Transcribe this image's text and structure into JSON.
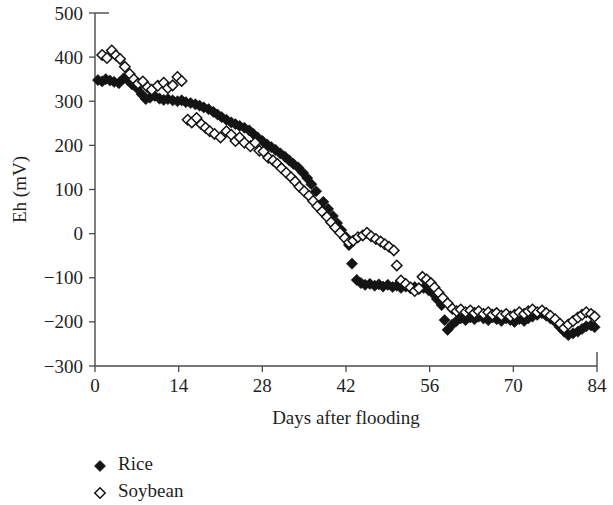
{
  "chart_data": {
    "type": "scatter",
    "title": "",
    "xlabel": "Days after flooding",
    "ylabel": "Eh (mV)",
    "xlim": [
      0,
      84
    ],
    "ylim": [
      -300,
      500
    ],
    "xticks": [
      0,
      14,
      28,
      42,
      56,
      70,
      84
    ],
    "yticks": [
      -300,
      -200,
      -100,
      0,
      100,
      200,
      300,
      400,
      500
    ],
    "xtick_labels": [
      "0",
      "14",
      "28",
      "42",
      "56",
      "70",
      "84"
    ],
    "ytick_labels": [
      "−300",
      "−200",
      "−100",
      "0",
      "100",
      "200",
      "300",
      "400",
      "500"
    ],
    "grid": false,
    "legend_position": "below-left",
    "series": [
      {
        "name": "Rice",
        "marker": "filled-diamond",
        "color": "#141414",
        "points": [
          [
            0.5,
            348
          ],
          [
            1.2,
            345
          ],
          [
            1.8,
            350
          ],
          [
            2.5,
            347
          ],
          [
            3.2,
            344
          ],
          [
            4.0,
            341
          ],
          [
            4.8,
            352
          ],
          [
            5.5,
            348
          ],
          [
            6.2,
            338
          ],
          [
            7.0,
            330
          ],
          [
            7.8,
            316
          ],
          [
            8.5,
            305
          ],
          [
            9.2,
            308
          ],
          [
            10.0,
            312
          ],
          [
            10.8,
            306
          ],
          [
            11.5,
            303
          ],
          [
            12.2,
            305
          ],
          [
            13.0,
            302
          ],
          [
            13.8,
            300
          ],
          [
            14.5,
            302
          ],
          [
            15.2,
            298
          ],
          [
            16.0,
            296
          ],
          [
            16.8,
            293
          ],
          [
            17.5,
            290
          ],
          [
            18.2,
            286
          ],
          [
            19.0,
            282
          ],
          [
            19.8,
            276
          ],
          [
            20.5,
            270
          ],
          [
            21.2,
            264
          ],
          [
            22.0,
            258
          ],
          [
            22.8,
            252
          ],
          [
            23.5,
            248
          ],
          [
            24.2,
            244
          ],
          [
            25.0,
            240
          ],
          [
            25.8,
            234
          ],
          [
            26.5,
            226
          ],
          [
            27.2,
            218
          ],
          [
            28.0,
            210
          ],
          [
            28.8,
            202
          ],
          [
            29.5,
            196
          ],
          [
            30.2,
            190
          ],
          [
            31.0,
            182
          ],
          [
            31.8,
            174
          ],
          [
            32.5,
            166
          ],
          [
            33.2,
            158
          ],
          [
            34.0,
            150
          ],
          [
            34.8,
            138
          ],
          [
            35.5,
            126
          ],
          [
            36.2,
            112
          ],
          [
            37.0,
            96
          ],
          [
            37.5,
            62
          ],
          [
            38.2,
            72
          ],
          [
            39.0,
            56
          ],
          [
            39.8,
            40
          ],
          [
            40.5,
            24
          ],
          [
            41.2,
            8
          ],
          [
            42.0,
            -8
          ],
          [
            42.5,
            -26
          ],
          [
            43.0,
            -68
          ],
          [
            43.8,
            -105
          ],
          [
            44.5,
            -112
          ],
          [
            45.2,
            -116
          ],
          [
            46.0,
            -114
          ],
          [
            46.8,
            -118
          ],
          [
            47.5,
            -115
          ],
          [
            48.2,
            -120
          ],
          [
            49.0,
            -116
          ],
          [
            49.8,
            -121
          ],
          [
            50.5,
            -118
          ],
          [
            51.2,
            -123
          ],
          [
            52.0,
            -120
          ],
          [
            52.8,
            -124
          ],
          [
            53.5,
            -121
          ],
          [
            54.2,
            -126
          ],
          [
            55.0,
            -123
          ],
          [
            55.8,
            -128
          ],
          [
            56.5,
            -135
          ],
          [
            57.2,
            -148
          ],
          [
            58.0,
            -162
          ],
          [
            58.5,
            -196
          ],
          [
            59.0,
            -218
          ],
          [
            59.8,
            -206
          ],
          [
            60.5,
            -198
          ],
          [
            61.2,
            -192
          ],
          [
            62.0,
            -196
          ],
          [
            62.8,
            -190
          ],
          [
            63.5,
            -194
          ],
          [
            64.2,
            -188
          ],
          [
            65.0,
            -192
          ],
          [
            65.8,
            -196
          ],
          [
            66.5,
            -190
          ],
          [
            67.2,
            -194
          ],
          [
            68.0,
            -198
          ],
          [
            68.8,
            -192
          ],
          [
            69.5,
            -196
          ],
          [
            70.2,
            -200
          ],
          [
            71.0,
            -194
          ],
          [
            71.8,
            -198
          ],
          [
            72.5,
            -192
          ],
          [
            73.2,
            -188
          ],
          [
            74.0,
            -184
          ],
          [
            74.8,
            -180
          ],
          [
            75.5,
            -186
          ],
          [
            76.2,
            -192
          ],
          [
            77.0,
            -200
          ],
          [
            77.8,
            -212
          ],
          [
            78.5,
            -222
          ],
          [
            79.2,
            -230
          ],
          [
            80.0,
            -226
          ],
          [
            80.8,
            -222
          ],
          [
            81.5,
            -216
          ],
          [
            82.2,
            -210
          ],
          [
            83.0,
            -208
          ],
          [
            83.6,
            -212
          ]
        ]
      },
      {
        "name": "Soybean",
        "marker": "open-diamond",
        "color": "#ffffff",
        "points": [
          [
            1.2,
            405
          ],
          [
            2.0,
            398
          ],
          [
            2.8,
            415
          ],
          [
            3.5,
            404
          ],
          [
            4.2,
            396
          ],
          [
            5.0,
            378
          ],
          [
            5.8,
            362
          ],
          [
            6.5,
            350
          ],
          [
            7.2,
            340
          ],
          [
            8.0,
            345
          ],
          [
            8.8,
            332
          ],
          [
            9.5,
            326
          ],
          [
            10.5,
            335
          ],
          [
            11.5,
            342
          ],
          [
            12.2,
            330
          ],
          [
            13.0,
            336
          ],
          [
            13.8,
            355
          ],
          [
            14.5,
            346
          ],
          [
            15.5,
            258
          ],
          [
            16.2,
            252
          ],
          [
            17.0,
            262
          ],
          [
            17.8,
            248
          ],
          [
            18.5,
            240
          ],
          [
            19.2,
            232
          ],
          [
            20.0,
            226
          ],
          [
            21.0,
            218
          ],
          [
            22.0,
            232
          ],
          [
            22.8,
            224
          ],
          [
            23.5,
            210
          ],
          [
            24.2,
            218
          ],
          [
            25.0,
            206
          ],
          [
            26.0,
            198
          ],
          [
            26.8,
            206
          ],
          [
            27.5,
            188
          ],
          [
            28.2,
            186
          ],
          [
            29.0,
            172
          ],
          [
            29.8,
            166
          ],
          [
            30.5,
            158
          ],
          [
            31.2,
            148
          ],
          [
            32.0,
            138
          ],
          [
            32.8,
            128
          ],
          [
            33.5,
            118
          ],
          [
            34.2,
            106
          ],
          [
            35.0,
            96
          ],
          [
            35.8,
            86
          ],
          [
            36.5,
            74
          ],
          [
            37.2,
            62
          ],
          [
            38.0,
            50
          ],
          [
            38.8,
            38
          ],
          [
            39.5,
            26
          ],
          [
            40.2,
            14
          ],
          [
            41.0,
            2
          ],
          [
            41.8,
            -10
          ],
          [
            42.5,
            -20
          ],
          [
            43.2,
            -16
          ],
          [
            44.0,
            -8
          ],
          [
            44.8,
            -4
          ],
          [
            45.5,
            2
          ],
          [
            46.2,
            -6
          ],
          [
            47.0,
            -12
          ],
          [
            47.8,
            -18
          ],
          [
            48.5,
            -24
          ],
          [
            49.2,
            -30
          ],
          [
            50.0,
            -38
          ],
          [
            50.5,
            -72
          ],
          [
            51.2,
            -106
          ],
          [
            52.0,
            -114
          ],
          [
            52.8,
            -122
          ],
          [
            53.5,
            -130
          ],
          [
            54.2,
            -124
          ],
          [
            54.8,
            -98
          ],
          [
            55.5,
            -104
          ],
          [
            56.2,
            -112
          ],
          [
            56.8,
            -122
          ],
          [
            57.5,
            -134
          ],
          [
            58.2,
            -146
          ],
          [
            59.0,
            -158
          ],
          [
            59.8,
            -170
          ],
          [
            60.5,
            -176
          ],
          [
            61.2,
            -172
          ],
          [
            62.0,
            -178
          ],
          [
            62.8,
            -174
          ],
          [
            63.5,
            -180
          ],
          [
            64.2,
            -176
          ],
          [
            65.0,
            -182
          ],
          [
            65.8,
            -178
          ],
          [
            66.5,
            -184
          ],
          [
            67.2,
            -180
          ],
          [
            68.0,
            -186
          ],
          [
            68.8,
            -182
          ],
          [
            69.5,
            -188
          ],
          [
            70.2,
            -184
          ],
          [
            71.0,
            -178
          ],
          [
            71.8,
            -182
          ],
          [
            72.5,
            -176
          ],
          [
            73.2,
            -172
          ],
          [
            74.0,
            -178
          ],
          [
            74.8,
            -174
          ],
          [
            75.5,
            -180
          ],
          [
            76.2,
            -186
          ],
          [
            77.0,
            -194
          ],
          [
            77.8,
            -204
          ],
          [
            78.5,
            -214
          ],
          [
            79.2,
            -206
          ],
          [
            80.0,
            -198
          ],
          [
            80.8,
            -190
          ],
          [
            81.5,
            -184
          ],
          [
            82.2,
            -178
          ],
          [
            83.0,
            -182
          ],
          [
            83.6,
            -188
          ]
        ]
      }
    ]
  },
  "legend": {
    "items": [
      {
        "label": "Rice",
        "marker": "filled-diamond"
      },
      {
        "label": "Soybean",
        "marker": "open-diamond"
      }
    ]
  }
}
